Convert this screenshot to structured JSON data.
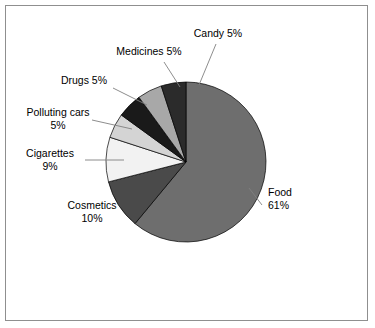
{
  "chart_data": {
    "type": "pie",
    "title": "",
    "subtitle": "",
    "legend_position": "labels-with-leader-lines",
    "grid": false,
    "start_angle_deg": 0,
    "direction": "clockwise",
    "categories": [
      "Food",
      "Cosmetics",
      "Cigarettes",
      "Polluting cars",
      "Drugs",
      "Medicines",
      "Candy"
    ],
    "values": [
      61,
      10,
      9,
      5,
      5,
      5,
      5
    ],
    "unit": "%",
    "slices": [
      {
        "name": "Food",
        "label": "Food",
        "value": 61,
        "value_text": "61%",
        "color": "#6e6e6e",
        "label_lines": [
          "Food",
          "61%"
        ]
      },
      {
        "name": "Cosmetics",
        "label": "Cosmetics",
        "value": 10,
        "value_text": "10%",
        "color": "#4a4a4a",
        "label_lines": [
          "Cosmetics",
          "10%"
        ]
      },
      {
        "name": "Cigarettes",
        "label": "Cigarettes",
        "value": 9,
        "value_text": "9%",
        "color": "#f2f2f2",
        "label_lines": [
          "Cigarettes",
          "9%"
        ]
      },
      {
        "name": "Polluting cars",
        "label": "Polluting cars",
        "value": 5,
        "value_text": "5%",
        "color": "#d4d4d4",
        "label_lines": [
          "Polluting cars",
          "5%"
        ]
      },
      {
        "name": "Drugs",
        "label": "Drugs",
        "value": 5,
        "value_text": "5%",
        "color": "#1a1a1a",
        "label_lines": [
          "Drugs 5%"
        ]
      },
      {
        "name": "Medicines",
        "label": "Medicines",
        "value": 5,
        "value_text": "5%",
        "color": "#a8a8a8",
        "label_lines": [
          "Medicines 5%"
        ]
      },
      {
        "name": "Candy",
        "label": "Candy",
        "value": 5,
        "value_text": "5%",
        "color": "#2b2b2b",
        "label_lines": [
          "Candy 5%"
        ]
      }
    ]
  },
  "labels": {
    "candy": "Candy 5%",
    "medicines": "Medicines 5%",
    "drugs": "Drugs 5%",
    "polluting_cars_name": "Polluting cars",
    "polluting_cars_value": "5%",
    "cigarettes_name": "Cigarettes",
    "cigarettes_value": "9%",
    "cosmetics_name": "Cosmetics",
    "cosmetics_value": "10%",
    "food_name": "Food",
    "food_value": "61%"
  },
  "colors": {
    "background": "#ffffff",
    "frame_border": "#8f8f8f",
    "slice_outline": "#000000",
    "leader_line": "#808080",
    "text": "#000000"
  }
}
